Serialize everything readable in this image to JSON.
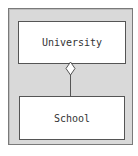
{
  "diagram": {
    "type": "uml-aggregation",
    "frame_color": "#d9d9d9",
    "nodes": [
      {
        "id": "university",
        "label": "University"
      },
      {
        "id": "school",
        "label": "School"
      }
    ],
    "edges": [
      {
        "from": "school",
        "to": "university",
        "kind": "aggregation",
        "end_marker": "hollow-diamond"
      }
    ]
  }
}
